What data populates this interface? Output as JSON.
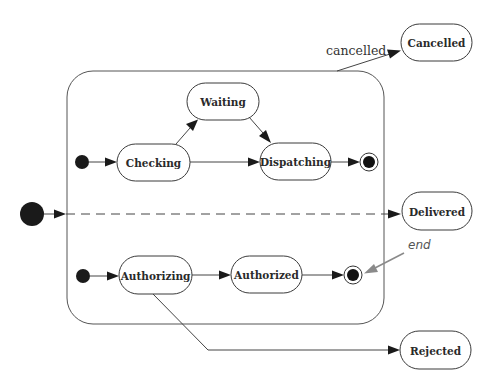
{
  "diagram": {
    "type": "uml-state-machine",
    "container": {
      "name": "composite-state",
      "label": ""
    },
    "states": {
      "waiting": {
        "label": "Waiting"
      },
      "checking": {
        "label": "Checking"
      },
      "dispatching": {
        "label": "Dispatching"
      },
      "authorizing": {
        "label": "Authorizing"
      },
      "authorized": {
        "label": "Authorized"
      },
      "cancelled": {
        "label": "Cancelled"
      },
      "delivered": {
        "label": "Delivered"
      },
      "rejected": {
        "label": "Rejected"
      }
    },
    "transitions": [
      {
        "from": "initial-outer",
        "to": "composite-state",
        "label": ""
      },
      {
        "from": "initial-upper",
        "to": "Checking",
        "label": ""
      },
      {
        "from": "Checking",
        "to": "Waiting",
        "label": ""
      },
      {
        "from": "Waiting",
        "to": "Dispatching",
        "label": ""
      },
      {
        "from": "Checking",
        "to": "Dispatching",
        "label": ""
      },
      {
        "from": "Dispatching",
        "to": "final-upper",
        "label": ""
      },
      {
        "from": "initial-lower",
        "to": "Authorizing",
        "label": ""
      },
      {
        "from": "Authorizing",
        "to": "Authorized",
        "label": ""
      },
      {
        "from": "Authorized",
        "to": "final-lower",
        "label": ""
      },
      {
        "from": "composite-state",
        "to": "Cancelled",
        "label": "cancelled"
      },
      {
        "from": "composite-state",
        "to": "Delivered",
        "label": "",
        "style": "dashed"
      },
      {
        "from": "Authorizing",
        "to": "Rejected",
        "label": ""
      }
    ],
    "edge_labels": {
      "cancelled": "cancelled"
    },
    "annotations": {
      "end": "end"
    },
    "colors": {
      "stroke": "#3a3a3a",
      "fill": "#ffffff",
      "pseudo": "#1a1a1a",
      "annotation": "#8a8a8a"
    }
  }
}
